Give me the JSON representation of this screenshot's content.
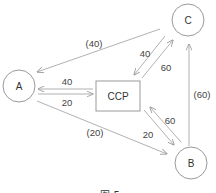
{
  "diagram": {
    "nodes": {
      "A": {
        "label": "A",
        "shape": "circle"
      },
      "B": {
        "label": "B",
        "shape": "circle"
      },
      "C": {
        "label": "C",
        "shape": "circle"
      },
      "CCP": {
        "label": "CCP",
        "shape": "rectangle"
      }
    },
    "edges": [
      {
        "id": "c_to_a",
        "from": "C",
        "to": "A",
        "label": "(40)"
      },
      {
        "id": "ccp_to_a",
        "from": "CCP",
        "to": "A",
        "label": "40"
      },
      {
        "id": "a_to_ccp",
        "from": "A",
        "to": "CCP",
        "label": "20"
      },
      {
        "id": "a_to_b",
        "from": "A",
        "to": "B",
        "label": "(20)"
      },
      {
        "id": "c_to_ccp",
        "from": "C",
        "to": "CCP",
        "label": "40"
      },
      {
        "id": "ccp_to_c",
        "from": "CCP",
        "to": "C",
        "label": "60"
      },
      {
        "id": "ccp_to_b",
        "from": "CCP",
        "to": "B",
        "label": "20"
      },
      {
        "id": "b_to_ccp",
        "from": "B",
        "to": "CCP",
        "label": "60"
      },
      {
        "id": "b_to_c",
        "from": "B",
        "to": "C",
        "label": "(60)"
      }
    ],
    "caption": "图 5",
    "colors": {
      "stroke": "#9a9a9a",
      "arrow": "#a8a8a8",
      "text": "#333333"
    }
  }
}
